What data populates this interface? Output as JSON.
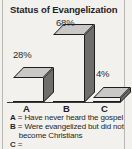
{
  "chart_title": "Status of Evangelization",
  "chart_data": {
    "type": "bar",
    "title": "Status of Evangelization",
    "categories": [
      "A",
      "B",
      "C"
    ],
    "values": [
      28,
      68,
      4
    ],
    "value_labels": [
      "28%",
      "68%",
      "4%"
    ],
    "xlabel": "",
    "ylabel": "",
    "ylim": [
      0,
      100
    ],
    "grid": false,
    "legend_position": "below",
    "style": "3d-bar",
    "series": [
      {
        "name": "Status of Evangelization",
        "values": [
          28,
          68,
          4
        ]
      }
    ],
    "annotations": [
      "A = Have never heard the gospel",
      "B = Were evangelized but did not become Christians",
      "C = "
    ]
  },
  "legend": {
    "separator": "=",
    "items": [
      {
        "key": "A",
        "lines": [
          "Have never heard the gospel"
        ]
      },
      {
        "key": "B",
        "lines": [
          "Were evangelized but did not",
          "become Christians"
        ]
      },
      {
        "key": "C",
        "lines": [
          ""
        ]
      }
    ]
  },
  "colors": {
    "background": "#f2f1ee",
    "bar_front": "#b0afaf",
    "bar_top": "#c9c8c6",
    "bar_side": "#6f6e6c",
    "outline": "#1d1d1d",
    "text": "#1f1f1f",
    "rule": "#b9b7b2"
  }
}
